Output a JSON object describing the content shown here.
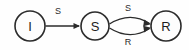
{
  "diagram": {
    "type": "state-transition-diagram",
    "background_color": "#fefefe",
    "stroke_color": "#2b2b2b",
    "label_color": "#1c1c1c",
    "nodes": [
      {
        "id": "I",
        "label": "I",
        "cx": 30,
        "cy": 26,
        "r": 15
      },
      {
        "id": "S",
        "label": "S",
        "cx": 95,
        "cy": 26,
        "r": 14
      },
      {
        "id": "R",
        "label": "R",
        "cx": 166,
        "cy": 26,
        "r": 15
      }
    ],
    "edges": [
      {
        "id": "edge-i-s",
        "from": "I",
        "to": "S",
        "label": "S",
        "shape": "straight",
        "path": "M 45.5 26 L 79 26",
        "label_x": 58,
        "label_y": 11
      },
      {
        "id": "edge-s-r-top",
        "from": "S",
        "to": "R",
        "label": "S",
        "shape": "curve-up",
        "path": "M 109.5 24 Q 130 11 149.6 23.5",
        "label_x": 128,
        "label_y": 8
      },
      {
        "id": "edge-s-r-bottom",
        "from": "S",
        "to": "R",
        "label": "R",
        "shape": "curve-down",
        "path": "M 109.5 28 Q 130 41 149.6 28.5",
        "label_x": 128,
        "label_y": 42
      }
    ],
    "arrowheads": [
      {
        "id": "arrow-into-s",
        "x": 80,
        "y": 26,
        "angle": 0
      },
      {
        "id": "arrow-into-r-top",
        "x": 150.5,
        "y": 23.8,
        "angle": 32
      },
      {
        "id": "arrow-into-r-bottom",
        "x": 150.5,
        "y": 28.2,
        "angle": -32
      }
    ]
  }
}
